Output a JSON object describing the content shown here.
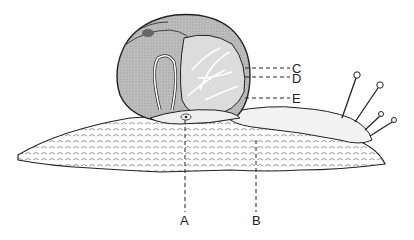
{
  "figure": {
    "colors": {
      "ink": "#222222",
      "shell_fill": "#b8b8b8",
      "body_fill": "#f4f4f4",
      "background": "#ffffff"
    },
    "labels": [
      {
        "id": "A",
        "text": "A",
        "x": 180,
        "y": 214
      },
      {
        "id": "B",
        "text": "B",
        "x": 252,
        "y": 214
      },
      {
        "id": "C",
        "text": "C",
        "x": 292,
        "y": 62
      },
      {
        "id": "D",
        "text": "D",
        "x": 292,
        "y": 73
      },
      {
        "id": "E",
        "text": "E",
        "x": 292,
        "y": 93
      }
    ]
  }
}
